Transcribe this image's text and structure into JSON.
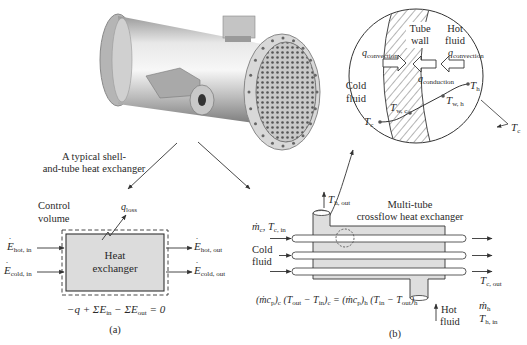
{
  "photo": {
    "caption_line1": "A typical shell-",
    "caption_line2": "and-tube heat exchanger"
  },
  "detail": {
    "tube_wall_line1": "Tube",
    "tube_wall_line2": "wall",
    "hot_fluid_line1": "Hot",
    "hot_fluid_line2": "fluid",
    "cold_fluid_line1": "Cold",
    "cold_fluid_line2": "fluid",
    "q_symbol": "q",
    "q_convection_sub": "convection",
    "q_conduction_sub": "conduction",
    "T_symbol": "T",
    "Th_sub": "h",
    "Tc_sub": "c",
    "Twc_sub": "w, c",
    "Twh_sub": "w, h",
    "Tc_outside_sub": "c"
  },
  "panel_a": {
    "control_volume_line1": "Control",
    "control_volume_line2": "volume",
    "q_loss_symbol": "q",
    "q_loss_sub": "loss",
    "box_line1": "Heat",
    "box_line2": "exchanger",
    "E_symbol": "E",
    "E_hot_in_sub": "hot, in",
    "E_cold_in_sub": "cold, in",
    "E_hot_out_sub": "hot, out",
    "E_cold_out_sub": "cold, out",
    "equation": "−q + ΣĖin − ΣĖout = 0",
    "eq_part1": "−q + Σ",
    "eq_E": "E",
    "eq_in": "in",
    "eq_minus": " − Σ",
    "eq_out": "out",
    "eq_end": " = 0",
    "label": "(a)"
  },
  "panel_b": {
    "title_line1": "Multi-tube",
    "title_line2": "crossflow heat exchanger",
    "Th_out_T": "T",
    "Th_out_sub": "h, out",
    "mc_Tc_in": "ṁ",
    "mc_sub": "c",
    "Tc_in_sub": "c, in",
    "cold_fluid_line1": "Cold",
    "cold_fluid_line2": "fluid",
    "Tc_out_T": "T",
    "Tc_out_sub": "c, out",
    "hot_fluid_line1": "Hot",
    "hot_fluid_line2": "fluid",
    "mh": "ṁ",
    "mh_sub": "h",
    "Th_in_T": "T",
    "Th_in_sub": "h, in",
    "equation": "(ṁcp)c (Tout − Tin)c = (ṁcp)h (Tin − Tout)h",
    "label": "(b)"
  },
  "colors": {
    "box_fill": "#dcdcdc",
    "shell_fill": "#dedede",
    "line": "#333333"
  }
}
